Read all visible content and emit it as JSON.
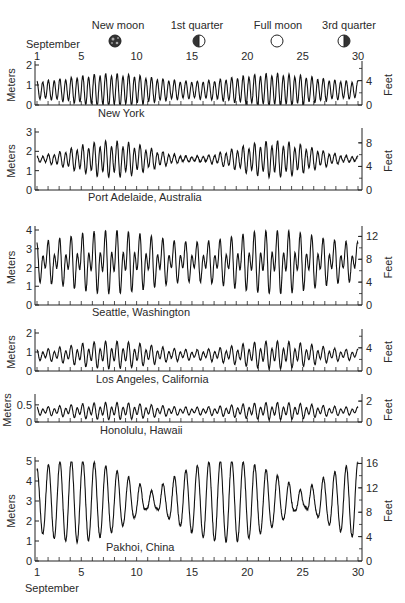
{
  "header": {
    "month_label": "September",
    "moon_phases": [
      {
        "label": "New moon",
        "icon": "new-moon-icon",
        "day": 8
      },
      {
        "label": "1st quarter",
        "icon": "first-quarter-icon",
        "day": 15
      },
      {
        "label": "Full moon",
        "icon": "full-moon-icon",
        "day": 22
      },
      {
        "label": "3rd quarter",
        "icon": "third-quarter-icon",
        "day": 29
      }
    ]
  },
  "footer": {
    "month_label": "September"
  },
  "chart_data": {
    "type": "line",
    "xlabel": "September (day)",
    "x_ticks": [
      1,
      5,
      10,
      15,
      20,
      25,
      30
    ],
    "x_range": [
      1,
      30
    ],
    "panels": [
      {
        "name": "New York",
        "ylabel_left": "Meters",
        "ylabel_right": "Feet",
        "ylim": [
          0,
          2
        ],
        "left_ticks": [
          0,
          1,
          2
        ],
        "right_ticks": [
          0,
          4
        ],
        "tide_type": "semidiurnal",
        "mean": 0.75,
        "range_min": 0.9,
        "range_max": 1.7,
        "diurnal_ineq": 0.1
      },
      {
        "name": "Port Adelaide, Australia",
        "ylabel_left": "Meters",
        "ylabel_right": "Feet",
        "ylim": [
          0,
          3
        ],
        "left_ticks": [
          0,
          1,
          2,
          3
        ],
        "right_ticks": [
          0,
          4,
          8
        ],
        "tide_type": "mixed",
        "mean": 1.6,
        "range_min": 0.3,
        "range_max": 2.0,
        "diurnal_ineq": 0.2
      },
      {
        "name": "Seattle, Washington",
        "ylabel_left": "Meters",
        "ylabel_right": "Feet",
        "ylim": [
          0,
          4
        ],
        "left_ticks": [
          0,
          1,
          2,
          3,
          4
        ],
        "right_ticks": [
          0,
          4,
          8,
          12
        ],
        "tide_type": "mixed",
        "mean": 2.3,
        "range_min": 2.4,
        "range_max": 3.8,
        "diurnal_ineq": 0.45
      },
      {
        "name": "Los Angeles, California",
        "ylabel_left": "Meters",
        "ylabel_right": "Feet",
        "ylim": [
          0,
          2
        ],
        "left_ticks": [
          0,
          1,
          2
        ],
        "right_ticks": [
          0,
          4
        ],
        "tide_type": "mixed",
        "mean": 0.85,
        "range_min": 0.6,
        "range_max": 1.6,
        "diurnal_ineq": 0.35
      },
      {
        "name": "Honolulu, Hawaii",
        "ylabel_left": "Meters",
        "ylabel_right": "Feet",
        "ylim": [
          0,
          0.7
        ],
        "left_ticks": [
          0,
          0.5
        ],
        "right_ticks": [
          0,
          2
        ],
        "tide_type": "mixed",
        "mean": 0.32,
        "range_min": 0.25,
        "range_max": 0.55,
        "diurnal_ineq": 0.35
      },
      {
        "name": "Pakhoi, China",
        "ylabel_left": "Meters",
        "ylabel_right": "Feet",
        "ylim": [
          0,
          5
        ],
        "left_ticks": [
          0,
          1,
          2,
          3,
          4,
          5
        ],
        "right_ticks": [
          0,
          4,
          8,
          12,
          16
        ],
        "tide_type": "diurnal",
        "mean": 3.0,
        "range_min": 0.6,
        "range_max": 4.0,
        "diurnal_ineq": 0
      }
    ]
  }
}
